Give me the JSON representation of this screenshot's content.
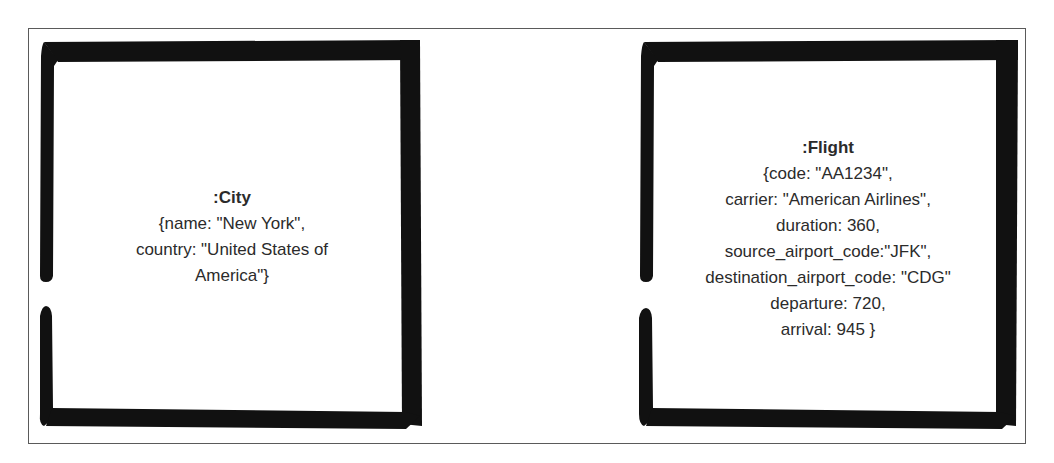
{
  "diagram": {
    "nodes": [
      {
        "id": "city",
        "label": ":City",
        "properties": [
          "{name: \"New York\",",
          "country: \"United States of",
          "America\"}"
        ]
      },
      {
        "id": "flight",
        "label": ":Flight",
        "properties": [
          "{code: \"AA1234\",",
          "carrier: \"American Airlines\",",
          "duration: 360,",
          "source_airport_code:\"JFK\",",
          "destination_airport_code: \"CDG\"",
          "departure: 720,",
          "arrival: 945 }"
        ]
      }
    ],
    "colors": {
      "stroke": "#111111",
      "frame": "#5a5a5a",
      "text": "#2b2b2b",
      "background": "#ffffff"
    }
  }
}
